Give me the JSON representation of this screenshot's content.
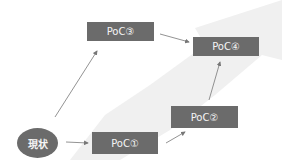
{
  "diagram": {
    "start": {
      "label": "現状"
    },
    "nodes": [
      {
        "id": "poc1",
        "label": "PoC①"
      },
      {
        "id": "poc2",
        "label": "PoC②"
      },
      {
        "id": "poc3",
        "label": "PoC③"
      },
      {
        "id": "poc4",
        "label": "PoC④"
      }
    ],
    "edges": [
      {
        "from": "現状",
        "to": "PoC①"
      },
      {
        "from": "現状",
        "to": "PoC③"
      },
      {
        "from": "PoC①",
        "to": "PoC②"
      },
      {
        "from": "PoC②",
        "to": "PoC④"
      },
      {
        "from": "PoC③",
        "to": "PoC④"
      }
    ],
    "colors": {
      "box": "#6b6b6b",
      "text": "#f4f4f4",
      "arrow": "#777777",
      "background_arrow": "#efefef"
    }
  }
}
